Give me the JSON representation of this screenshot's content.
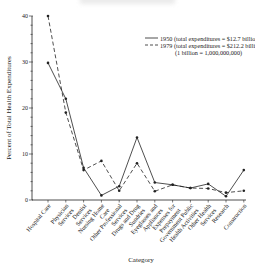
{
  "chart_data": {
    "type": "line",
    "title": "",
    "xlabel": "Category",
    "ylabel": "Percent of Total Health Expenditures",
    "ylim": [
      0,
      40
    ],
    "yticks": [
      0,
      10,
      20,
      30,
      40
    ],
    "grid": false,
    "legend_position": "upper right",
    "categories": [
      "Hospital Care",
      "Physician Services",
      "Dentist Services",
      "Nursing Home Care",
      "Other Professional Services",
      "Drugs and Drug Sundries",
      "Eyeglasses and Appliances",
      "Expenses for Prepayment",
      "Government Public Health Activities",
      "Other Health Services",
      "Research",
      "Construction"
    ],
    "series": [
      {
        "name": "1950 (total expenditures = $12.7 billion)",
        "style": "solid",
        "values": [
          29.8,
          22.0,
          7.0,
          1.0,
          3.0,
          13.6,
          3.8,
          3.3,
          2.6,
          3.5,
          0.8,
          6.5
        ]
      },
      {
        "name": "1979 (total expenditures = $212.2 billion)",
        "style": "dashed",
        "values": [
          40.0,
          19.0,
          6.5,
          8.5,
          2.0,
          8.0,
          1.9,
          3.3,
          2.6,
          2.5,
          1.6,
          2.0
        ]
      }
    ],
    "annotations": [
      "(1 billion = 1,000,000,000)"
    ]
  },
  "legend": {
    "line1": "1950 (total expenditures =  $12.7 billion)",
    "line2": "1979 (total expenditures = $212.2 billion)",
    "note": "(1 billion = 1,000,000,000)"
  },
  "category_labels": [
    [
      "Hospital Care"
    ],
    [
      "Physician",
      "Services"
    ],
    [
      "Dentist",
      "Services"
    ],
    [
      "Nursing Home",
      "Care"
    ],
    [
      "Other Professional",
      "Services"
    ],
    [
      "Drugs and Drug",
      "Sundries"
    ],
    [
      "Eyeglasses and",
      "Appliances"
    ],
    [
      "Expenses for",
      "Prepayment"
    ],
    [
      "Government Public",
      "Health Activities"
    ],
    [
      "Other Health",
      "Services"
    ],
    [
      "Research"
    ],
    [
      "Construction"
    ]
  ]
}
